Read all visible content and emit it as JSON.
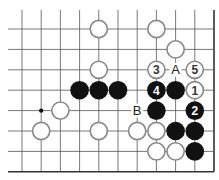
{
  "diagram": {
    "type": "go-board-fragment",
    "columns": 11,
    "rows": 8,
    "edges": {
      "right": true,
      "bottom": true,
      "top": false,
      "left": false
    },
    "star_points": [
      {
        "col": 1,
        "row": 4
      }
    ],
    "stones": [
      {
        "color": "white",
        "col": 4,
        "row": 0,
        "label": ""
      },
      {
        "color": "white",
        "col": 7,
        "row": 0,
        "label": ""
      },
      {
        "color": "white",
        "col": 8,
        "row": 1,
        "label": ""
      },
      {
        "color": "white",
        "col": 4,
        "row": 2,
        "label": ""
      },
      {
        "color": "white",
        "col": 7,
        "row": 2,
        "label": "3"
      },
      {
        "color": "white",
        "col": 9,
        "row": 2,
        "label": "5"
      },
      {
        "color": "black",
        "col": 3,
        "row": 3,
        "label": ""
      },
      {
        "color": "black",
        "col": 4,
        "row": 3,
        "label": ""
      },
      {
        "color": "black",
        "col": 5,
        "row": 3,
        "label": ""
      },
      {
        "color": "black",
        "col": 7,
        "row": 3,
        "label": "4"
      },
      {
        "color": "black",
        "col": 8,
        "row": 3,
        "label": ""
      },
      {
        "color": "white",
        "col": 9,
        "row": 3,
        "label": "1"
      },
      {
        "color": "white",
        "col": 2,
        "row": 4,
        "label": ""
      },
      {
        "color": "black",
        "col": 7,
        "row": 4,
        "label": ""
      },
      {
        "color": "black",
        "col": 9,
        "row": 4,
        "label": "2"
      },
      {
        "color": "white",
        "col": 1,
        "row": 5,
        "label": ""
      },
      {
        "color": "white",
        "col": 4,
        "row": 5,
        "label": ""
      },
      {
        "color": "white",
        "col": 6,
        "row": 5,
        "label": ""
      },
      {
        "color": "white",
        "col": 7,
        "row": 5,
        "label": ""
      },
      {
        "color": "black",
        "col": 8,
        "row": 5,
        "label": ""
      },
      {
        "color": "black",
        "col": 9,
        "row": 5,
        "label": ""
      },
      {
        "color": "white",
        "col": 7,
        "row": 6,
        "label": ""
      },
      {
        "color": "white",
        "col": 8,
        "row": 6,
        "label": ""
      },
      {
        "color": "black",
        "col": 9,
        "row": 6,
        "label": ""
      }
    ],
    "point_labels": [
      {
        "col": 8,
        "row": 2,
        "text": "A"
      },
      {
        "col": 6,
        "row": 4,
        "text": "B"
      }
    ],
    "colors": {
      "line": "#555555",
      "edge": "#333333",
      "black_stone": "#111111",
      "white_stone_fill": "#ffffff",
      "white_stone_stroke": "#888888"
    }
  }
}
